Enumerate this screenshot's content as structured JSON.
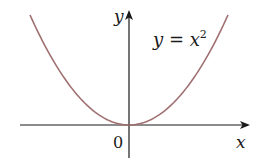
{
  "chart_data": {
    "type": "line",
    "title": "",
    "equation": "y = x^2",
    "equation_label": {
      "base": "y = x",
      "exponent": "2"
    },
    "xlabel": "x",
    "ylabel": "y",
    "origin_label": "0",
    "series": [
      {
        "name": "y = x^2",
        "color": "#a07070",
        "x": [
          -2,
          -1.5,
          -1,
          -0.5,
          0,
          0.5,
          1,
          1.5,
          2
        ],
        "values": [
          4,
          2.25,
          1,
          0.25,
          0,
          0.25,
          1,
          2.25,
          4
        ]
      }
    ],
    "xlim": [
      -2.4,
      2.4
    ],
    "ylim": [
      -0.8,
      4.2
    ],
    "grid": false,
    "legend": "none",
    "axes_color": "#1a1a1a"
  }
}
